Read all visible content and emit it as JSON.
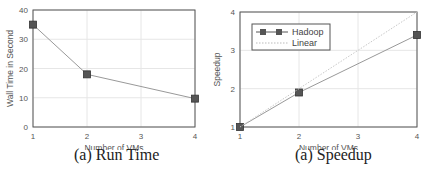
{
  "chart_data": [
    {
      "type": "line",
      "title": "",
      "caption": "(a) Run Time",
      "xlabel": "Number of VMs",
      "ylabel": "Wall Time in Second",
      "x": [
        1,
        2,
        4
      ],
      "series": [
        {
          "name": "Run Time",
          "values": [
            35,
            18,
            9.7
          ],
          "marker": "square",
          "color": "#555555"
        }
      ],
      "xlim": [
        1,
        4
      ],
      "ylim": [
        0,
        40
      ],
      "xticks": [
        "1",
        "2",
        "3",
        "4"
      ],
      "yticks": [
        "0",
        "10",
        "20",
        "30",
        "40"
      ],
      "grid": true,
      "legend": null
    },
    {
      "type": "line",
      "title": "",
      "caption": "(a) Speedup",
      "xlabel": "Number of VMs",
      "ylabel": "Speedup",
      "x": [
        1,
        2,
        4
      ],
      "series": [
        {
          "name": "Hadoop",
          "values": [
            1,
            1.9,
            3.4
          ],
          "marker": "square",
          "color": "#555555"
        },
        {
          "name": "Linear",
          "values": [
            1,
            2,
            4
          ],
          "style": "dotted",
          "color": "#bbbbbb",
          "x": [
            1,
            4
          ],
          "y": [
            1,
            4
          ]
        }
      ],
      "xlim": [
        1,
        4
      ],
      "ylim": [
        1,
        4
      ],
      "xticks": [
        "1",
        "2",
        "3",
        "4"
      ],
      "yticks": [
        "1",
        "2",
        "3",
        "4"
      ],
      "grid": true,
      "legend": {
        "position": "upper left",
        "entries": [
          "Hadoop",
          "Linear"
        ]
      }
    }
  ]
}
